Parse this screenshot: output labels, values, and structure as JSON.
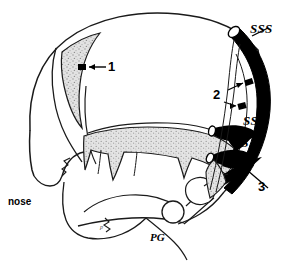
{
  "figure": {
    "name": "sagittal-skull-diagram",
    "background_color": "#ffffff",
    "ink_color": "#1a1a1a",
    "stipple_color": "#d6d6d6",
    "sinus_color": "#000000",
    "width": 294,
    "height": 265
  },
  "labels": {
    "sss": "SSS",
    "ss": "SS",
    "ts": "TS",
    "one": "1",
    "two": "2",
    "three": "3",
    "nose": "nose",
    "pg": "PG",
    "small_mark": "p"
  }
}
